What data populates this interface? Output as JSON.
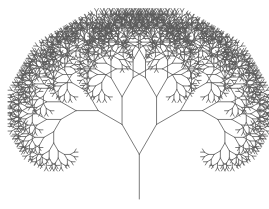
{
  "image": {
    "width": 269,
    "height": 209,
    "background": "#ffffff",
    "subject": "fractal binary tree"
  },
  "tree": {
    "stroke_color": "#5a5a5a",
    "stroke_width": 0.8,
    "trunk": {
      "x": 139.3,
      "y_bottom": 199,
      "y_top": 154.3
    },
    "first_branch_length": 34.5,
    "branch_angle_deg": 30,
    "length_ratio": 0.8,
    "depth": 11
  }
}
